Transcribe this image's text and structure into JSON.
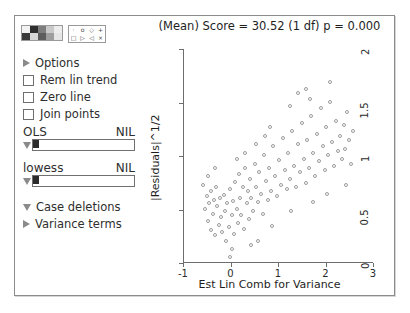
{
  "window": {
    "title_bar": false
  },
  "panel": {
    "palette": {
      "name": "color-palette",
      "swatches": [
        "#f2f2f2",
        "#2f2f2f",
        "#7d7d7d",
        "#c9c9c9",
        "#ededed",
        "#3a3a3a",
        "#d8d8d8",
        "#5c5c5c",
        "#9e9e9e",
        "#e6e6e6"
      ],
      "symbols": [
        "·",
        "o",
        "◇",
        "+",
        "□",
        "▷",
        "◁",
        "×"
      ]
    },
    "options_label": "Options",
    "checkboxes": [
      {
        "label": "Rem lin trend",
        "checked": false
      },
      {
        "label": "Zero line",
        "checked": false
      },
      {
        "label": "Join points",
        "checked": false
      }
    ],
    "sliders": [
      {
        "label": "OLS",
        "value": "NIL"
      },
      {
        "label": "lowess",
        "value": "NIL"
      }
    ],
    "menus": [
      {
        "label": "Case deletions",
        "state": "down"
      },
      {
        "label": "Variance terms",
        "state": "right"
      }
    ]
  },
  "chart_data": {
    "type": "scatter",
    "title": "(Mean) Score = 30.52 (1 df) p = 0.000",
    "xlabel": "Est Lin Comb for Variance",
    "ylabel": "|Residuals|^1/2",
    "xlim": [
      -1,
      3
    ],
    "ylim": [
      0,
      2
    ],
    "xticks": [
      -1,
      0,
      1,
      2,
      3
    ],
    "yticks": [
      0,
      0.5,
      1,
      1.5,
      2
    ],
    "xtick_labels": [
      "-1",
      "0",
      "1",
      "2",
      "3"
    ],
    "ytick_labels": [
      "0",
      "0.5",
      "1",
      "1.5",
      "2"
    ],
    "grid": false,
    "legend": false,
    "marker": "open-circle",
    "marker_color": "#9b9b9b",
    "points": [
      [
        -0.55,
        0.72
      ],
      [
        -0.52,
        0.5
      ],
      [
        -0.48,
        0.62
      ],
      [
        -0.46,
        0.38
      ],
      [
        -0.44,
        0.55
      ],
      [
        -0.4,
        0.3
      ],
      [
        -0.38,
        0.66
      ],
      [
        -0.35,
        0.45
      ],
      [
        -0.33,
        0.58
      ],
      [
        -0.3,
        0.25
      ],
      [
        -0.28,
        0.7
      ],
      [
        -0.26,
        0.52
      ],
      [
        -0.22,
        0.35
      ],
      [
        -0.2,
        0.6
      ],
      [
        -0.18,
        0.42
      ],
      [
        -0.15,
        0.28
      ],
      [
        -0.12,
        0.63
      ],
      [
        -0.1,
        0.48
      ],
      [
        -0.08,
        0.2
      ],
      [
        -0.05,
        0.55
      ],
      [
        -0.02,
        0.33
      ],
      [
        0.0,
        0.05
      ],
      [
        0.02,
        0.68
      ],
      [
        0.05,
        0.44
      ],
      [
        0.08,
        0.57
      ],
      [
        0.1,
        0.26
      ],
      [
        0.12,
        0.75
      ],
      [
        0.15,
        0.5
      ],
      [
        0.18,
        0.36
      ],
      [
        0.2,
        0.82
      ],
      [
        0.22,
        0.6
      ],
      [
        0.25,
        0.44
      ],
      [
        0.28,
        0.7
      ],
      [
        0.3,
        0.31
      ],
      [
        0.33,
        0.88
      ],
      [
        0.36,
        0.55
      ],
      [
        0.38,
        0.66
      ],
      [
        0.4,
        0.4
      ],
      [
        0.43,
        0.78
      ],
      [
        0.46,
        0.6
      ],
      [
        0.5,
        0.48
      ],
      [
        0.53,
        0.92
      ],
      [
        0.56,
        0.7
      ],
      [
        0.6,
        0.56
      ],
      [
        0.63,
        0.84
      ],
      [
        0.66,
        0.64
      ],
      [
        0.7,
        0.45
      ],
      [
        0.73,
        1.0
      ],
      [
        0.76,
        0.76
      ],
      [
        0.8,
        0.58
      ],
      [
        0.84,
        0.88
      ],
      [
        0.88,
        0.66
      ],
      [
        0.92,
        1.08
      ],
      [
        0.96,
        0.8
      ],
      [
        1.0,
        0.62
      ],
      [
        1.04,
        0.95
      ],
      [
        1.08,
        0.72
      ],
      [
        1.12,
        1.16
      ],
      [
        1.16,
        0.86
      ],
      [
        1.2,
        0.68
      ],
      [
        1.24,
        1.02
      ],
      [
        1.28,
        0.78
      ],
      [
        1.32,
        1.22
      ],
      [
        1.36,
        0.9
      ],
      [
        1.4,
        0.7
      ],
      [
        1.44,
        1.1
      ],
      [
        1.48,
        0.84
      ],
      [
        1.52,
        1.3
      ],
      [
        1.56,
        0.96
      ],
      [
        1.6,
        0.74
      ],
      [
        1.64,
        1.14
      ],
      [
        1.68,
        0.88
      ],
      [
        1.72,
        1.36
      ],
      [
        1.76,
        1.02
      ],
      [
        1.8,
        0.8
      ],
      [
        1.84,
        1.2
      ],
      [
        1.88,
        0.94
      ],
      [
        1.92,
        1.44
      ],
      [
        1.96,
        1.08
      ],
      [
        2.0,
        0.86
      ],
      [
        2.04,
        1.26
      ],
      [
        2.08,
        1.0
      ],
      [
        2.12,
        1.5
      ],
      [
        2.16,
        1.12
      ],
      [
        2.2,
        0.9
      ],
      [
        2.24,
        1.32
      ],
      [
        2.28,
        1.04
      ],
      [
        2.32,
        1.18
      ],
      [
        2.36,
        0.96
      ],
      [
        2.4,
        1.28
      ],
      [
        2.44,
        1.06
      ],
      [
        2.48,
        1.4
      ],
      [
        2.52,
        1.14
      ],
      [
        2.56,
        0.92
      ],
      [
        2.6,
        1.22
      ],
      [
        2.12,
        1.68
      ],
      [
        1.62,
        1.62
      ],
      [
        1.44,
        1.58
      ],
      [
        1.28,
        1.46
      ],
      [
        1.7,
        1.52
      ],
      [
        0.86,
        1.26
      ],
      [
        0.74,
        1.18
      ],
      [
        0.55,
        1.1
      ],
      [
        0.33,
        1.02
      ],
      [
        0.16,
        0.96
      ],
      [
        -0.3,
        0.88
      ],
      [
        -0.45,
        0.8
      ],
      [
        0.6,
        0.2
      ],
      [
        0.9,
        0.34
      ],
      [
        1.3,
        0.48
      ],
      [
        1.75,
        0.56
      ],
      [
        2.05,
        0.64
      ],
      [
        2.45,
        0.72
      ],
      [
        0.05,
        0.12
      ],
      [
        0.45,
        0.16
      ]
    ]
  }
}
